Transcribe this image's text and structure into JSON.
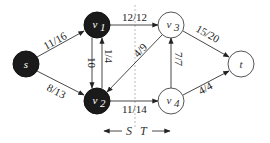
{
  "diagram": {
    "type": "flow-network-cut",
    "nodes": [
      {
        "id": "s",
        "label": "s",
        "sub": "",
        "x": 26,
        "y": 64,
        "side": "S"
      },
      {
        "id": "v1",
        "label": "v",
        "sub": "1",
        "x": 97,
        "y": 25,
        "side": "S"
      },
      {
        "id": "v2",
        "label": "v",
        "sub": "2",
        "x": 97,
        "y": 101,
        "side": "S"
      },
      {
        "id": "v3",
        "label": "v",
        "sub": "3",
        "x": 171,
        "y": 25,
        "side": "T"
      },
      {
        "id": "v4",
        "label": "v",
        "sub": "4",
        "x": 171,
        "y": 101,
        "side": "T"
      },
      {
        "id": "t",
        "label": "t",
        "sub": "",
        "x": 241,
        "y": 64,
        "side": "T"
      }
    ],
    "edges": [
      {
        "from": "s",
        "to": "v1",
        "label": "11/16"
      },
      {
        "from": "s",
        "to": "v2",
        "label": "8/13"
      },
      {
        "from": "v1",
        "to": "v2",
        "label": "10"
      },
      {
        "from": "v2",
        "to": "v1",
        "label": "1/4"
      },
      {
        "from": "v1",
        "to": "v3",
        "label": "12/12"
      },
      {
        "from": "v3",
        "to": "v2",
        "label": "4/9"
      },
      {
        "from": "v2",
        "to": "v4",
        "label": "11/14"
      },
      {
        "from": "v4",
        "to": "v3",
        "label": "7/7"
      },
      {
        "from": "v3",
        "to": "t",
        "label": "15/20"
      },
      {
        "from": "v4",
        "to": "t",
        "label": "4/4"
      }
    ],
    "cut": {
      "left_label": "S",
      "right_label": "T",
      "x": 135
    },
    "colors": {
      "s_side_fill": "#1a1a1a",
      "t_side_fill": "#ffffff",
      "stroke": "#333333",
      "cut_line": "#aaaaaa"
    }
  }
}
